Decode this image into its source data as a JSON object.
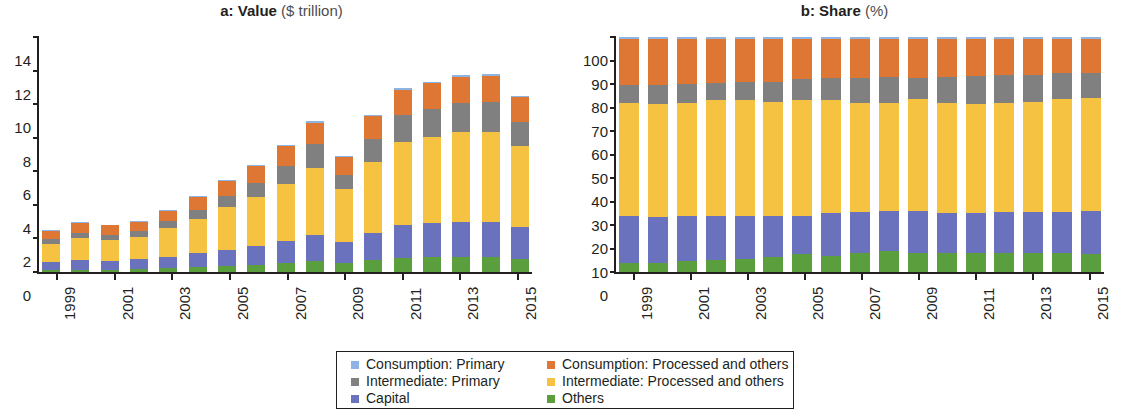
{
  "figure": {
    "panels": [
      {
        "id": "a",
        "label": "a:",
        "title_bold": "Value",
        "title_light": "($ trillion)"
      },
      {
        "id": "b",
        "label": "b:",
        "title_bold": "Share",
        "title_light": "(%)"
      }
    ]
  },
  "legend": {
    "col1": [
      {
        "label": "Consumption: Primary",
        "color": "#8eb4e3"
      },
      {
        "label": "Intermediate: Primary",
        "color": "#808080"
      },
      {
        "label": "Capital",
        "color": "#6b72bd"
      }
    ],
    "col2": [
      {
        "label": "Consumption: Processed and others",
        "color": "#dd7733"
      },
      {
        "label": "Intermediate: Processed and others",
        "color": "#f5c242"
      },
      {
        "label": "Others",
        "color": "#5a9e3d"
      }
    ]
  },
  "chart_data": [
    {
      "type": "bar",
      "stacked": true,
      "panel": "a",
      "title": "a: Value ($ trillion)",
      "xlabel": "",
      "ylabel": "$ trillion",
      "ylim": [
        0,
        14
      ],
      "yticks": [
        0,
        2,
        4,
        6,
        8,
        10,
        12,
        14
      ],
      "ytick_labels": [
        "0",
        "2",
        "4",
        "6",
        "8",
        "10",
        "12",
        "14"
      ],
      "grid": false,
      "legend_position": "bottom-center",
      "categories": [
        1999,
        2000,
        2001,
        2002,
        2003,
        2004,
        2005,
        2006,
        2007,
        2008,
        2009,
        2010,
        2011,
        2012,
        2013,
        2014,
        2015
      ],
      "xtick_labels": [
        "1999",
        "2001",
        "2003",
        "2005",
        "2007",
        "2009",
        "2011",
        "2013",
        "2015"
      ],
      "series": [
        {
          "name": "Others",
          "color": "#5a9e3d",
          "values": [
            0.1,
            0.12,
            0.13,
            0.15,
            0.22,
            0.3,
            0.38,
            0.43,
            0.52,
            0.65,
            0.52,
            0.7,
            0.85,
            0.88,
            0.92,
            0.92,
            0.78
          ]
        },
        {
          "name": "Capital",
          "color": "#6b72bd",
          "values": [
            0.5,
            0.58,
            0.55,
            0.6,
            0.68,
            0.82,
            0.95,
            1.1,
            1.3,
            1.57,
            1.25,
            1.62,
            1.95,
            2.02,
            2.05,
            2.08,
            1.88
          ]
        },
        {
          "name": "Intermediate: Processed and others",
          "color": "#f5c242",
          "values": [
            1.1,
            1.32,
            1.25,
            1.35,
            1.7,
            2.05,
            2.52,
            2.92,
            3.42,
            3.98,
            3.18,
            4.25,
            4.95,
            5.12,
            5.35,
            5.35,
            4.85
          ]
        },
        {
          "name": "Intermediate: Primary",
          "color": "#808080",
          "values": [
            0.28,
            0.33,
            0.3,
            0.32,
            0.42,
            0.55,
            0.7,
            0.88,
            1.1,
            1.4,
            0.85,
            1.35,
            1.6,
            1.68,
            1.75,
            1.78,
            1.4
          ]
        },
        {
          "name": "Consumption: Processed and others",
          "color": "#dd7733",
          "values": [
            0.48,
            0.6,
            0.55,
            0.58,
            0.62,
            0.75,
            0.88,
            1.0,
            1.15,
            1.3,
            1.05,
            1.35,
            1.5,
            1.55,
            1.55,
            1.55,
            1.5
          ]
        },
        {
          "name": "Consumption: Primary",
          "color": "#8eb4e3",
          "values": [
            0.04,
            0.05,
            0.05,
            0.05,
            0.06,
            0.08,
            0.07,
            0.07,
            0.08,
            0.1,
            0.07,
            0.08,
            0.1,
            0.1,
            0.1,
            0.1,
            0.09
          ]
        }
      ]
    },
    {
      "type": "bar",
      "stacked": true,
      "panel": "b",
      "title": "b: Share (%)",
      "xlabel": "",
      "ylabel": "%",
      "ylim": [
        0,
        100
      ],
      "yticks": [
        0,
        10,
        20,
        30,
        40,
        50,
        60,
        70,
        80,
        90,
        100
      ],
      "ytick_labels": [
        "0",
        "10",
        "20",
        "30",
        "40",
        "50",
        "60",
        "70",
        "80",
        "90",
        "100"
      ],
      "grid": false,
      "legend_position": "bottom-center",
      "categories": [
        1999,
        2000,
        2001,
        2002,
        2003,
        2004,
        2005,
        2006,
        2007,
        2008,
        2009,
        2010,
        2011,
        2012,
        2013,
        2014,
        2015
      ],
      "xtick_labels": [
        "1999",
        "2001",
        "2003",
        "2005",
        "2007",
        "2009",
        "2011",
        "2013",
        "2015"
      ],
      "series": [
        {
          "name": "Others",
          "color": "#5a9e3d",
          "values": [
            4.0,
            4.0,
            4.5,
            5.0,
            5.5,
            6.5,
            7.5,
            7.0,
            8.0,
            9.0,
            8.0,
            8.0,
            8.0,
            8.0,
            8.0,
            8.0,
            7.5
          ]
        },
        {
          "name": "Capital",
          "color": "#6b72bd",
          "values": [
            20.0,
            19.5,
            19.5,
            19.0,
            18.5,
            17.5,
            16.5,
            18.0,
            17.5,
            17.0,
            18.0,
            17.0,
            17.0,
            17.5,
            17.5,
            17.5,
            18.5
          ]
        },
        {
          "name": "Intermediate: Processed and others",
          "color": "#f5c242",
          "values": [
            48.0,
            48.0,
            48.0,
            49.0,
            49.0,
            48.5,
            49.0,
            48.0,
            46.5,
            46.0,
            47.5,
            47.0,
            46.5,
            46.5,
            47.0,
            48.0,
            48.0
          ]
        },
        {
          "name": "Intermediate: Primary",
          "color": "#808080",
          "values": [
            7.5,
            8.0,
            8.0,
            7.5,
            8.0,
            8.5,
            9.0,
            9.5,
            10.5,
            11.0,
            9.0,
            11.0,
            12.0,
            12.0,
            11.5,
            11.0,
            10.5
          ]
        },
        {
          "name": "Consumption: Processed and others",
          "color": "#dd7733",
          "values": [
            19.5,
            19.5,
            19.0,
            18.5,
            18.0,
            18.0,
            17.0,
            16.5,
            16.5,
            16.0,
            16.5,
            16.0,
            15.5,
            15.0,
            15.0,
            14.5,
            14.5
          ]
        },
        {
          "name": "Consumption: Primary",
          "color": "#8eb4e3",
          "values": [
            1.0,
            1.0,
            1.0,
            1.0,
            1.0,
            1.0,
            1.0,
            1.0,
            1.0,
            1.0,
            1.0,
            1.0,
            1.0,
            1.0,
            1.0,
            1.0,
            1.0
          ]
        }
      ]
    }
  ]
}
